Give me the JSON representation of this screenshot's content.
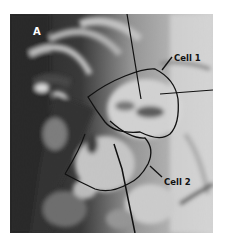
{
  "figure": {
    "panel_label": "A",
    "labels": [
      {
        "id": "cell1",
        "text": "Cell 1"
      },
      {
        "id": "cell2",
        "text": "Cell 2"
      }
    ],
    "colors": {
      "background": "#ffffff",
      "dark_tissue": "#1a1a1a",
      "light_tissue": "#e6e6e6",
      "outline": "#111111",
      "panel_label_text": "#ffffff",
      "label_text": "#111111"
    }
  }
}
